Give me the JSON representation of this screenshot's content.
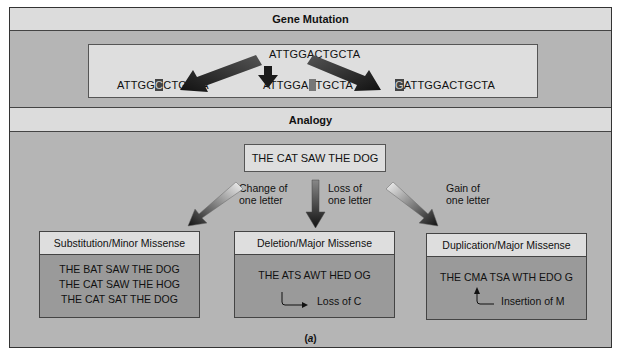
{
  "gene_mutation": {
    "title": "Gene Mutation",
    "original": "ATTGGACTGCTA",
    "results": [
      {
        "before": "ATTGG",
        "highlight": "C",
        "after": "CTGCTA",
        "type": "substitution"
      },
      {
        "before": "ATTGGA",
        "highlight": "",
        "after": "TGCTA",
        "type": "deletion"
      },
      {
        "before": "",
        "highlight": "G",
        "after": "ATTGGACTGCTA",
        "type": "duplication"
      }
    ]
  },
  "analogy": {
    "title": "Analogy",
    "sentence": "THE CAT SAW THE DOG",
    "arrows": [
      {
        "line1": "Change of",
        "line2": "one letter"
      },
      {
        "line1": "Loss of",
        "line2": "one letter"
      },
      {
        "line1": "Gain of",
        "line2": "one letter"
      }
    ],
    "boxes": [
      {
        "title": "Substitution/Minor Missense",
        "lines": [
          "THE BAT SAW THE DOG",
          "THE CAT SAW THE HOG",
          "THE CAT SAT THE DOG"
        ]
      },
      {
        "title": "Deletion/Major Missense",
        "lines": [
          "THE ATS AWT HED OG"
        ],
        "note": "Loss of C"
      },
      {
        "title": "Duplication/Major Missense",
        "lines": [
          "THE CMA TSA WTH EDO G"
        ],
        "note": "Insertion of M"
      }
    ]
  },
  "caption": {
    "open": "(",
    "letter": "a",
    "close": ")"
  }
}
